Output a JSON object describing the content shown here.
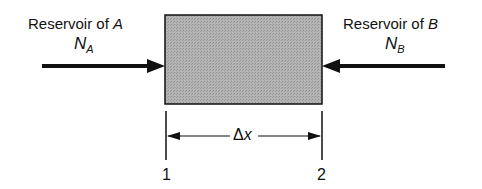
{
  "diagram": {
    "left": {
      "label": "Reservoir of",
      "species": "A",
      "flux_symbol": "N",
      "flux_subscript": "A"
    },
    "right": {
      "label": "Reservoir of",
      "species": "B",
      "flux_symbol": "N",
      "flux_subscript": "B"
    },
    "dimension": {
      "label_delta": "Δ",
      "label_var": "x"
    },
    "positions": {
      "start": "1",
      "end": "2"
    },
    "colors": {
      "box_fill": "#a8a8a8",
      "stroke": "#111111"
    }
  }
}
